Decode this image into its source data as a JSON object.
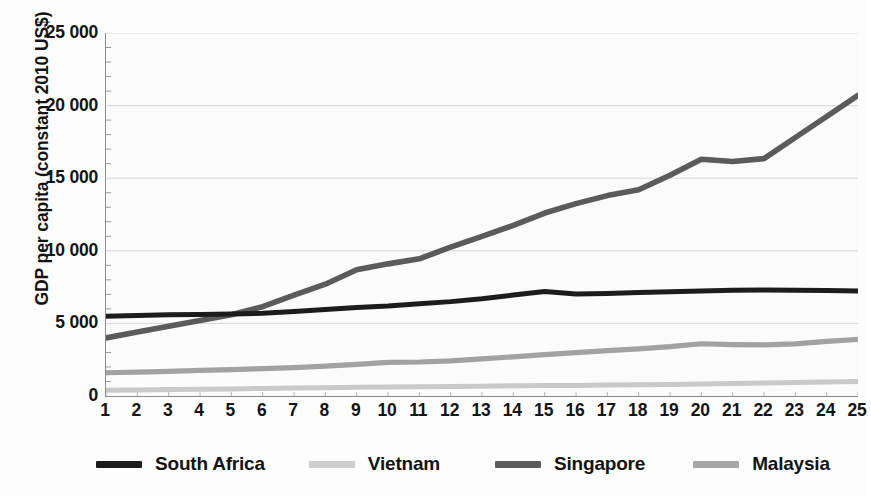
{
  "chart_data": {
    "type": "line",
    "title": "",
    "xlabel": "",
    "ylabel": "GDP per capita (constant 2010 US$)",
    "xlim": [
      1,
      25
    ],
    "ylim": [
      0,
      25000
    ],
    "grid": "horizontal",
    "legend_position": "bottom",
    "x": [
      1,
      2,
      3,
      4,
      5,
      6,
      7,
      8,
      9,
      10,
      11,
      12,
      13,
      14,
      15,
      16,
      17,
      18,
      19,
      20,
      21,
      22,
      23,
      24,
      25
    ],
    "y_ticks": [
      0,
      5000,
      10000,
      15000,
      20000,
      25000
    ],
    "y_tick_labels": [
      "0",
      "5 000",
      "10 000",
      "15 000",
      "20 000",
      "25 000"
    ],
    "x_tick_labels": [
      "1",
      "2",
      "3",
      "4",
      "5",
      "6",
      "7",
      "8",
      "9",
      "10",
      "11",
      "12",
      "13",
      "14",
      "15",
      "16",
      "17",
      "18",
      "19",
      "20",
      "21",
      "22",
      "23",
      "24",
      "25"
    ],
    "series": [
      {
        "name": "South Africa",
        "color": "#1c1c1c",
        "width": 5.0,
        "values": [
          5500,
          5550,
          5600,
          5620,
          5640,
          5700,
          5820,
          5950,
          6100,
          6200,
          6350,
          6500,
          6700,
          6950,
          7200,
          7020,
          7060,
          7120,
          7180,
          7230,
          7280,
          7300,
          7290,
          7260,
          7230
        ]
      },
      {
        "name": "Vietnam",
        "color": "#c9c9c9",
        "width": 5.0,
        "values": [
          400,
          420,
          440,
          460,
          490,
          520,
          545,
          570,
          600,
          620,
          640,
          660,
          680,
          700,
          715,
          730,
          750,
          775,
          800,
          830,
          860,
          890,
          925,
          965,
          1000
        ]
      },
      {
        "name": "Singapore",
        "color": "#5b5b5b",
        "width": 5.6,
        "values": [
          4000,
          4400,
          4800,
          5200,
          5600,
          6150,
          6950,
          7700,
          8700,
          9100,
          9450,
          10250,
          11000,
          11750,
          12600,
          13250,
          13800,
          14200,
          15200,
          16300,
          16150,
          16350,
          17800,
          19250,
          20700
        ]
      },
      {
        "name": "Malaysia",
        "color": "#a2a2a2",
        "width": 5.2,
        "values": [
          1600,
          1650,
          1700,
          1760,
          1820,
          1880,
          1960,
          2060,
          2180,
          2320,
          2340,
          2420,
          2560,
          2700,
          2850,
          2990,
          3120,
          3250,
          3400,
          3600,
          3540,
          3520,
          3590,
          3760,
          3900
        ]
      }
    ]
  },
  "axis": {
    "y_title": "GDP per capita (constant 2010 US$)"
  },
  "legend": {
    "entries": [
      {
        "label": "South Africa",
        "color": "#1c1c1c"
      },
      {
        "label": "Vietnam",
        "color": "#cdcdcd"
      },
      {
        "label": "Singapore",
        "color": "#5b5b5b"
      },
      {
        "label": "Malaysia",
        "color": "#a6a6a6"
      }
    ]
  },
  "colors": {
    "axis": "#8d8d8d",
    "grid": "#d8d8d8",
    "text": "#141414",
    "plot_background": "#fbfbfb"
  }
}
